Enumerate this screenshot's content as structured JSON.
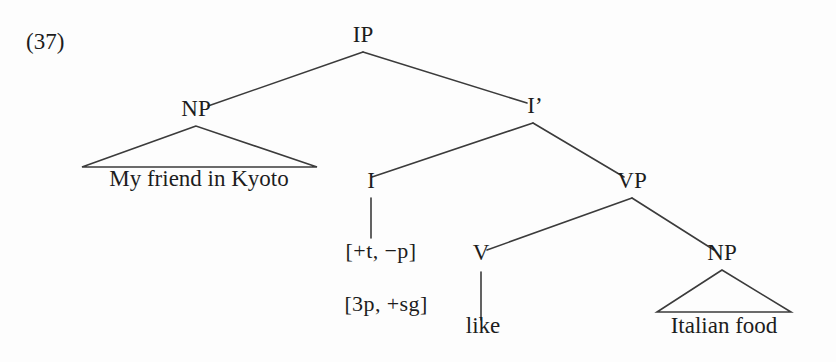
{
  "figure": {
    "example_number": "(37)",
    "background_color": "#fdfdfd",
    "line_color": "#3b3b3b",
    "text_color": "#1d1d1d"
  },
  "tree": {
    "nodes": [
      {
        "id": "ip",
        "label": "IP",
        "kind": "category",
        "x": 363,
        "y": 46
      },
      {
        "id": "np_subj",
        "label": "NP",
        "kind": "category",
        "x": 196,
        "y": 120
      },
      {
        "id": "ibar",
        "label": "I’",
        "kind": "category",
        "x": 535,
        "y": 117
      },
      {
        "id": "i",
        "label": "I",
        "kind": "category",
        "x": 371,
        "y": 192
      },
      {
        "id": "vp",
        "label": "VP",
        "kind": "category",
        "x": 632,
        "y": 192
      },
      {
        "id": "v",
        "label": "V",
        "kind": "category",
        "x": 481,
        "y": 264
      },
      {
        "id": "np_obj",
        "label": "NP",
        "kind": "category",
        "x": 722,
        "y": 264
      },
      {
        "id": "feat1",
        "label": "[+t, −p]",
        "kind": "feature",
        "x": 381,
        "y": 262
      },
      {
        "id": "feat2",
        "label": "[3p, +sg]",
        "kind": "feature",
        "x": 386,
        "y": 315
      },
      {
        "id": "leaf_subj",
        "label": "My friend in Kyoto",
        "kind": "leaf",
        "x": 199,
        "y": 190
      },
      {
        "id": "leaf_v",
        "label": "like",
        "kind": "leaf",
        "x": 483,
        "y": 337
      },
      {
        "id": "leaf_obj",
        "label": "Italian food",
        "kind": "leaf",
        "x": 724,
        "y": 337
      }
    ],
    "edges": [
      {
        "from": "ip",
        "to": "np_subj",
        "x1": 363,
        "y1": 52,
        "x2": 208,
        "y2": 106
      },
      {
        "from": "ip",
        "to": "ibar",
        "x1": 363,
        "y1": 52,
        "x2": 527,
        "y2": 103
      },
      {
        "from": "ibar",
        "to": "i",
        "x1": 533,
        "y1": 123,
        "x2": 372,
        "y2": 177
      },
      {
        "from": "ibar",
        "to": "vp",
        "x1": 533,
        "y1": 123,
        "x2": 624,
        "y2": 177
      },
      {
        "from": "i",
        "to": "feat",
        "x1": 371,
        "y1": 198,
        "x2": 371,
        "y2": 238
      },
      {
        "from": "vp",
        "to": "v",
        "x1": 632,
        "y1": 198,
        "x2": 487,
        "y2": 250
      },
      {
        "from": "vp",
        "to": "np_obj",
        "x1": 632,
        "y1": 198,
        "x2": 714,
        "y2": 250
      },
      {
        "from": "v",
        "to": "leaf_v",
        "x1": 481,
        "y1": 272,
        "x2": 481,
        "y2": 320
      }
    ],
    "triangles": [
      {
        "node": "np_subj",
        "apex_x": 196,
        "apex_y": 126,
        "left_x": 82,
        "right_x": 317,
        "base_y": 167
      },
      {
        "node": "np_obj",
        "apex_x": 722,
        "apex_y": 270,
        "left_x": 657,
        "right_x": 791,
        "base_y": 312
      }
    ]
  }
}
